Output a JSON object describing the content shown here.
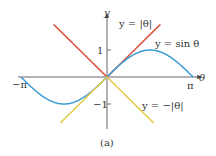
{
  "chart_data": {
    "type": "line",
    "title": "",
    "caption": "(a)",
    "xlabel": "θ",
    "ylabel": "y",
    "x_ticks": [
      {
        "label": "−π",
        "value": -3.14159
      },
      {
        "label": "π",
        "value": 3.14159
      }
    ],
    "y_ticks": [
      {
        "label": "1",
        "value": 1
      },
      {
        "label": "−1",
        "value": -1
      }
    ],
    "xlim": [
      -3.14159,
      3.14159
    ],
    "ylim": [
      -1.9,
      2.0
    ],
    "grid": false,
    "series": [
      {
        "name": "y = |θ|",
        "label": "y = |θ|",
        "color": "#d9533a",
        "function": "abs",
        "x_range": [
          -1.95,
          1.95
        ]
      },
      {
        "name": "y = sin θ",
        "label": "y = sin θ",
        "color": "#3a9bd5",
        "function": "sin",
        "x_range": [
          -3.14159,
          3.14159
        ]
      },
      {
        "name": "y = −|θ|",
        "label": "y = −|θ|",
        "color": "#e3cc4a",
        "function": "neg_abs",
        "x_range": [
          -1.7,
          1.7
        ]
      }
    ],
    "annotations": [
      {
        "text": "y = |θ|",
        "near_series": "y = |θ|"
      },
      {
        "text": "y = sin θ",
        "near_series": "y = sin θ"
      },
      {
        "text": "y = −|θ|",
        "near_series": "y = −|θ|"
      }
    ]
  }
}
